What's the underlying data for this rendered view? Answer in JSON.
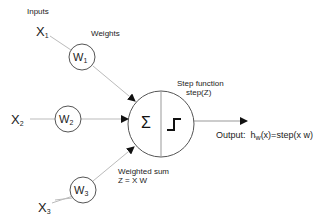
{
  "diagram": {
    "type": "perceptron",
    "labels": {
      "inputs": "Inputs",
      "weights": "Weights",
      "step_function": "Step function",
      "step_z": "step(Z)",
      "weighted_sum": "Weighted sum",
      "weighted_sum_formula": "Z = X W",
      "output_prefix": "Output:",
      "output_h": "h",
      "output_sub": "w",
      "output_formula": "(x)=step(x w)",
      "sigma": "Σ"
    },
    "inputs": [
      {
        "name": "X",
        "sub": "1"
      },
      {
        "name": "X",
        "sub": "2"
      },
      {
        "name": "X",
        "sub": "3"
      }
    ],
    "weights": [
      {
        "name": "W",
        "sub": "1"
      },
      {
        "name": "W",
        "sub": "2"
      },
      {
        "name": "W",
        "sub": "3"
      }
    ],
    "colors": {
      "line": "#b0b0b0",
      "circle": "#555555",
      "arrow": "#111111",
      "text": "#222222"
    }
  }
}
